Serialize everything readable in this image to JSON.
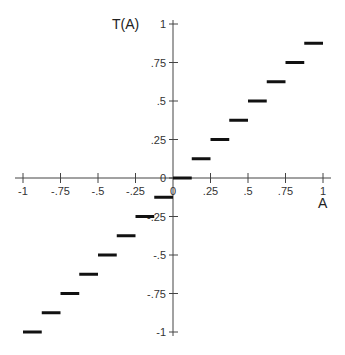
{
  "chart_data": {
    "type": "line",
    "subtype": "step",
    "title": "",
    "xlabel": "A",
    "ylabel": "T(A)",
    "xlim": [
      -1,
      1
    ],
    "ylim": [
      -1,
      1
    ],
    "grid": false,
    "legend": null,
    "x_ticks": [
      "-1",
      "-.75",
      "-.5",
      "-.25",
      "0",
      ".25",
      ".5",
      ".75",
      "1"
    ],
    "x_tick_values": [
      -1,
      -0.75,
      -0.5,
      -0.25,
      0,
      0.25,
      0.5,
      0.75,
      1
    ],
    "y_ticks": [
      "1",
      ".75",
      ".5",
      ".25",
      "0",
      "-.25",
      "-.5",
      "-.75",
      "-1"
    ],
    "y_tick_values": [
      1,
      0.75,
      0.5,
      0.25,
      0,
      -0.25,
      -0.5,
      -0.75,
      -1
    ],
    "series": [
      {
        "name": "T(A)",
        "segments": [
          {
            "x_start": -1.0,
            "x_end": -0.875,
            "y": -1.0
          },
          {
            "x_start": -0.875,
            "x_end": -0.75,
            "y": -0.875
          },
          {
            "x_start": -0.75,
            "x_end": -0.625,
            "y": -0.75
          },
          {
            "x_start": -0.625,
            "x_end": -0.5,
            "y": -0.625
          },
          {
            "x_start": -0.5,
            "x_end": -0.375,
            "y": -0.5
          },
          {
            "x_start": -0.375,
            "x_end": -0.25,
            "y": -0.375
          },
          {
            "x_start": -0.25,
            "x_end": -0.125,
            "y": -0.25
          },
          {
            "x_start": -0.125,
            "x_end": 0.0,
            "y": -0.125
          },
          {
            "x_start": 0.0,
            "x_end": 0.125,
            "y": 0.0
          },
          {
            "x_start": 0.125,
            "x_end": 0.25,
            "y": 0.125
          },
          {
            "x_start": 0.25,
            "x_end": 0.375,
            "y": 0.25
          },
          {
            "x_start": 0.375,
            "x_end": 0.5,
            "y": 0.375
          },
          {
            "x_start": 0.5,
            "x_end": 0.625,
            "y": 0.5
          },
          {
            "x_start": 0.625,
            "x_end": 0.75,
            "y": 0.625
          },
          {
            "x_start": 0.75,
            "x_end": 0.875,
            "y": 0.75
          },
          {
            "x_start": 0.875,
            "x_end": 1.0,
            "y": 0.875
          }
        ]
      }
    ],
    "colors": {
      "axis": "#444444",
      "step": "#111111",
      "text": "#333333"
    }
  }
}
